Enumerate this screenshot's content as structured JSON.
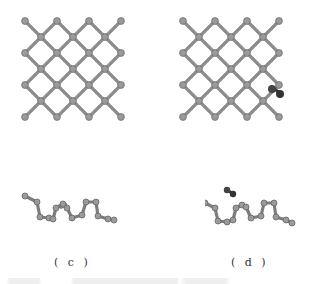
{
  "figure": {
    "panels": [
      {
        "id": "a",
        "view": "top",
        "description": "pristine lattice top view"
      },
      {
        "id": "b",
        "view": "top",
        "description": "lattice with adsorbed dimer top view"
      },
      {
        "id": "c",
        "view": "side",
        "label": "( c )",
        "description": "pristine lattice side view"
      },
      {
        "id": "d",
        "view": "side",
        "label": "( d )",
        "description": "lattice with adsorbed dimer side view"
      }
    ],
    "colors": {
      "atom": "#8a8a8a",
      "bond": "#7d7d7d",
      "adsorbate": "#333333"
    }
  }
}
